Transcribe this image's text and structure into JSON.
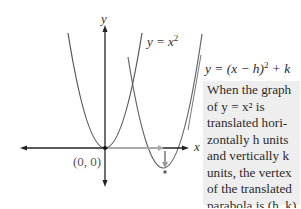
{
  "diagram": {
    "type": "parabola-translation",
    "axes": {
      "x_label": "x",
      "y_label": "y",
      "origin_label": "(0, 0)"
    },
    "curves": [
      {
        "name": "parent",
        "equation_label": "y = x²",
        "vertex": [
          0,
          0
        ]
      },
      {
        "name": "translated",
        "equation_label": "y = (x − h)² + k",
        "vertex": [
          "h",
          "k"
        ]
      }
    ],
    "translation_arrows": [
      "horizontal h",
      "vertical k"
    ]
  },
  "labels": {
    "y_axis": "y",
    "x_axis": "x",
    "origin": "(0, 0)",
    "parent_eq_prefix": "y = x",
    "parent_eq_exp": "2",
    "translated_eq_prefix": "y = (x − h)",
    "translated_eq_exp": "2",
    "translated_eq_suffix": " + k"
  },
  "note": {
    "lines": [
      "When the graph",
      "of y = x² is",
      "translated hori-",
      "zontally h units",
      "and vertically k",
      "units, the vertex",
      "of the translated",
      "parabola is (h, k)."
    ]
  },
  "colors": {
    "axis": "#222222",
    "curve": "#555555",
    "arrow_gray": "#9a9a9a",
    "box_bg": "#eeeeee"
  }
}
